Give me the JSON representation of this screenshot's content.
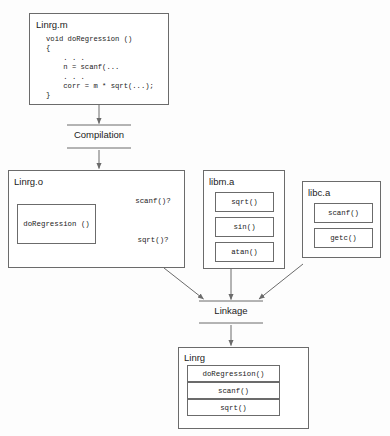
{
  "diagram": {
    "colors": {
      "stroke": "#6b6b6b",
      "arrow": "#6b6b6b",
      "text": "#1b1b1b",
      "background": "#fdfdfd",
      "box_fill": "#ffffff"
    }
  },
  "source_file": {
    "name": "Linrg.m",
    "code_lines": [
      "void doRegression ()",
      "{",
      "    . . .",
      "    n = scanf(...",
      "    . . .",
      "    corr = m * sqrt(...);",
      "}"
    ]
  },
  "stages": {
    "compilation": "Compilation",
    "linkage": "Linkage"
  },
  "object_file": {
    "name": "Linrg.o",
    "function_box": "doRegression ()",
    "unresolved": [
      {
        "label": "scanf()?"
      },
      {
        "label": "sqrt()?"
      }
    ]
  },
  "libraries": [
    {
      "name": "libm.a",
      "symbols": [
        "sqrt()",
        "sin()",
        "atan()"
      ]
    },
    {
      "name": "libc.a",
      "symbols": [
        "scanf()",
        "getc()"
      ]
    }
  ],
  "executable": {
    "name": "Linrg",
    "rows": [
      "doRegression()",
      "scanf()",
      "sqrt()"
    ]
  }
}
